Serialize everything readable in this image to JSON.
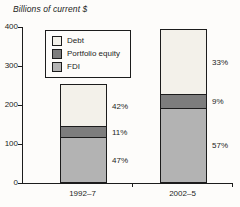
{
  "title": "Billions of current $",
  "chart_data": {
    "type": "bar",
    "stacked": true,
    "title": "Billions of current $",
    "ylabel": "Billions of current $",
    "xlabel": "",
    "categories": [
      "1992–7",
      "2002–5"
    ],
    "series": [
      {
        "name": "FDI",
        "color": "#b3b3b3",
        "values": [
          115,
          190
        ],
        "percent_labels": [
          "47%",
          "57%"
        ]
      },
      {
        "name": "Portfolio equity",
        "color": "#7d7d7d",
        "values": [
          26,
          33
        ],
        "percent_labels": [
          "11%",
          "9%"
        ]
      },
      {
        "name": "Debt",
        "color": "#f3f1ea",
        "values": [
          108,
          167
        ],
        "percent_labels": [
          "42%",
          "33%"
        ]
      }
    ],
    "series_order_note": "bottom-to-top stacking",
    "legend": [
      "Debt",
      "Portfolio equity",
      "FDI"
    ],
    "legend_position": "upper-left",
    "ylim": [
      0,
      400
    ],
    "yticks": [
      0,
      100,
      200,
      300,
      400
    ],
    "grid": false
  },
  "colors": {
    "background": "#fdfcfa",
    "axis": "#1c1c1c",
    "text": "#1c1c1c",
    "bar_border": "#1c1c1c"
  }
}
